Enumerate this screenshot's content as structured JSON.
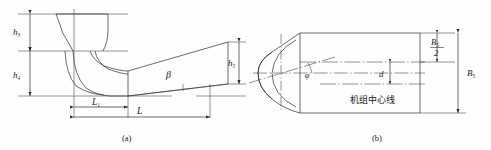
{
  "figure": {
    "kind": "engineering-line-drawing",
    "subfigures": [
      {
        "caption": "(a)",
        "view": "longitudinal section",
        "dimension_labels": [
          {
            "symbol": "h",
            "subscript": "3",
            "text": "h3"
          },
          {
            "symbol": "h",
            "subscript": "4",
            "text": "h4"
          },
          {
            "symbol": "h",
            "subscript": "5",
            "text": "h5"
          },
          {
            "symbol": "L",
            "subscript": "1",
            "text": "L1"
          },
          {
            "symbol": "L",
            "subscript": "",
            "text": "L"
          }
        ],
        "angle_labels": [
          {
            "symbol": "β",
            "text": "β"
          }
        ]
      },
      {
        "caption": "(b)",
        "view": "plan",
        "dimension_labels": [
          {
            "symbol": "B",
            "subscript": "5",
            "text": "B5",
            "fraction": "B5 / 2"
          },
          {
            "symbol": "B",
            "subscript": "5",
            "text": "B5"
          },
          {
            "symbol": "d",
            "subscript": "",
            "text": "d"
          }
        ],
        "angle_labels": [
          {
            "symbol": "φ",
            "text": "φ"
          }
        ],
        "annotations": [
          {
            "text": "机组中心线",
            "meaning": "unit-centre-line"
          }
        ]
      }
    ]
  },
  "labels": {
    "h3": "h",
    "h3_sub": "3",
    "h4": "h",
    "h4_sub": "4",
    "h5": "h",
    "h5_sub": "5",
    "L1": "L",
    "L1_sub": "1",
    "L": "L",
    "beta": "β",
    "phi": "φ",
    "d": "d",
    "B_half_num": "B",
    "B_half_num_sub": "5",
    "B_half_den": "2",
    "B5": "B",
    "B5_sub": "5",
    "centerline_cn": "机组中心线",
    "caption_a": "(a)",
    "caption_b": "(b)"
  },
  "colors": {
    "line": "#2b2b2b",
    "thin": "#4a4a4a",
    "background": "#fefefe",
    "text": "#1a1a1a"
  }
}
